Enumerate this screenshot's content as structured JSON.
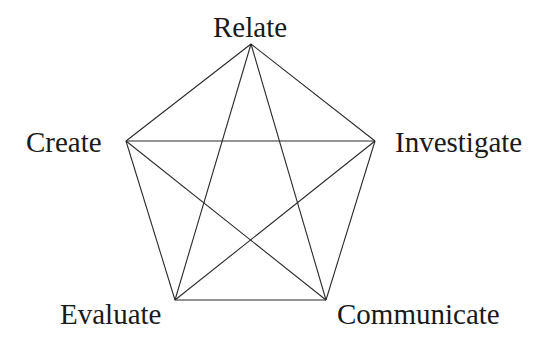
{
  "diagram": {
    "type": "complete-graph-pentagram",
    "line_color": "#2a2a2a",
    "text_color": "#1a1a1a",
    "nodes": [
      {
        "id": "relate",
        "label": "Relate",
        "x": 251,
        "y": 44,
        "label_x": 213,
        "label_y": 13
      },
      {
        "id": "investigate",
        "label": "Investigate",
        "x": 375,
        "y": 141,
        "label_x": 395,
        "label_y": 128
      },
      {
        "id": "communicate",
        "label": "Communicate",
        "x": 326,
        "y": 300,
        "label_x": 337,
        "label_y": 300
      },
      {
        "id": "evaluate",
        "label": "Evaluate",
        "x": 175,
        "y": 300,
        "label_x": 60,
        "label_y": 300
      },
      {
        "id": "create",
        "label": "Create",
        "x": 126,
        "y": 141,
        "label_x": 26,
        "label_y": 128
      }
    ],
    "edges": [
      [
        "relate",
        "investigate"
      ],
      [
        "investigate",
        "communicate"
      ],
      [
        "communicate",
        "evaluate"
      ],
      [
        "evaluate",
        "create"
      ],
      [
        "create",
        "relate"
      ],
      [
        "relate",
        "evaluate"
      ],
      [
        "relate",
        "communicate"
      ],
      [
        "create",
        "investigate"
      ],
      [
        "create",
        "communicate"
      ],
      [
        "investigate",
        "evaluate"
      ]
    ]
  }
}
